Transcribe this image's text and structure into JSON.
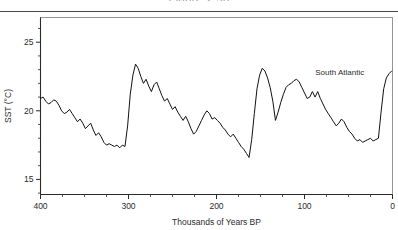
{
  "figure": {
    "caption": "Figure 2.30"
  },
  "chart_data": {
    "type": "line",
    "title": "",
    "subtitle": "",
    "xlabel": "Thousands of Years BP",
    "ylabel": "SST (°C)",
    "xlim": [
      400,
      0
    ],
    "ylim": [
      13.9,
      26.8
    ],
    "x_axis_reversed": true,
    "grid": false,
    "legend_position": "inline-annotation",
    "xticks": [
      400,
      300,
      200,
      100,
      0
    ],
    "xtick_labels": [
      "400",
      "300",
      "200",
      "100",
      "0"
    ],
    "x_minor_tick_interval": 25,
    "yticks": [
      15,
      20,
      25
    ],
    "ytick_labels": [
      "15",
      "20",
      "25"
    ],
    "y_minor_tick_interval": 1,
    "line_color": "#111111",
    "line_width": 1.0,
    "series": [
      {
        "name": "South Atlantic",
        "annotation": "South Atlantic",
        "annotation_x": 60,
        "annotation_y": 22.6,
        "x": [
          400,
          397,
          394,
          391,
          388,
          385,
          382,
          379,
          376,
          373,
          370,
          367,
          364,
          361,
          358,
          355,
          352,
          349,
          346,
          343,
          340,
          337,
          334,
          331,
          328,
          325,
          322,
          319,
          316,
          313,
          310,
          307,
          304,
          301,
          298,
          295,
          292,
          289,
          286,
          283,
          280,
          277,
          274,
          271,
          268,
          265,
          262,
          259,
          256,
          253,
          250,
          247,
          244,
          241,
          238,
          235,
          232,
          229,
          226,
          223,
          220,
          217,
          214,
          211,
          208,
          205,
          202,
          199,
          196,
          193,
          190,
          187,
          184,
          181,
          178,
          175,
          172,
          169,
          166,
          163,
          160,
          157,
          154,
          151,
          148,
          145,
          142,
          139,
          136,
          133,
          130,
          127,
          124,
          121,
          118,
          115,
          112,
          109,
          106,
          103,
          100,
          97,
          94,
          91,
          88,
          85,
          82,
          79,
          76,
          73,
          70,
          67,
          64,
          61,
          58,
          55,
          52,
          49,
          46,
          43,
          40,
          37,
          34,
          31,
          28,
          25,
          22,
          19,
          16,
          13,
          10,
          7,
          4,
          1
        ],
        "y": [
          20.9,
          21.0,
          20.7,
          20.5,
          20.6,
          20.8,
          20.7,
          20.4,
          20.0,
          19.8,
          19.9,
          20.1,
          19.8,
          19.5,
          19.2,
          19.4,
          19.1,
          18.7,
          18.9,
          19.1,
          18.6,
          18.2,
          18.4,
          18.1,
          17.7,
          17.5,
          17.6,
          17.5,
          17.4,
          17.5,
          17.3,
          17.5,
          17.4,
          18.9,
          21.2,
          22.6,
          23.4,
          23.1,
          22.5,
          22.0,
          22.3,
          21.8,
          21.4,
          21.9,
          22.1,
          21.6,
          21.1,
          20.7,
          20.9,
          20.5,
          20.1,
          20.3,
          19.9,
          19.6,
          19.3,
          19.6,
          19.2,
          18.7,
          18.3,
          18.5,
          18.9,
          19.3,
          19.7,
          20.0,
          19.8,
          19.4,
          19.5,
          19.3,
          19.1,
          18.8,
          18.6,
          18.3,
          18.1,
          18.3,
          18.0,
          17.7,
          17.4,
          17.2,
          16.9,
          16.6,
          17.9,
          19.8,
          21.6,
          22.6,
          23.1,
          22.9,
          22.4,
          21.7,
          20.7,
          19.3,
          19.9,
          20.6,
          21.2,
          21.7,
          21.9,
          22.0,
          22.2,
          22.3,
          22.1,
          21.7,
          21.3,
          20.9,
          21.0,
          21.4,
          21.0,
          21.4,
          20.9,
          20.5,
          20.1,
          19.8,
          19.5,
          19.2,
          18.9,
          19.1,
          19.4,
          19.2,
          18.8,
          18.5,
          18.3,
          18.0,
          17.8,
          17.9,
          17.7,
          17.8,
          17.9,
          18.0,
          17.8,
          17.9,
          18.0,
          19.9,
          21.6,
          22.4,
          22.7,
          22.9
        ]
      }
    ]
  }
}
